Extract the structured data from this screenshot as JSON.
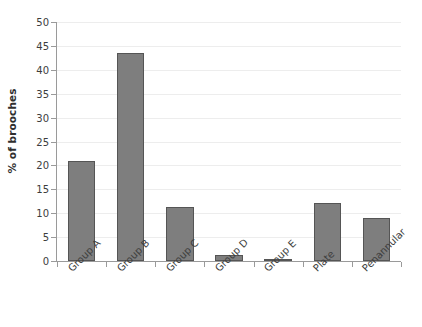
{
  "chart_data": {
    "type": "bar",
    "title": "",
    "subtitle": "",
    "xlabel": "",
    "ylabel": "% of brooches",
    "categories": [
      "Group A",
      "Group B",
      "Group C",
      "Group D",
      "Group E",
      "Plate",
      "Penannular"
    ],
    "values": [
      21.0,
      43.5,
      11.3,
      1.3,
      0.5,
      12.2,
      9.1
    ],
    "ylim": [
      0,
      50
    ],
    "ytick_step": 5,
    "yticks": [
      0,
      5,
      10,
      15,
      20,
      25,
      30,
      35,
      40,
      45,
      50
    ],
    "ytick_labels": [
      "0",
      "5",
      "10",
      "15",
      "20",
      "25",
      "30",
      "35",
      "40",
      "45",
      "50"
    ],
    "grid": true,
    "grid_axis": "y",
    "legend": false,
    "legend_position": "none",
    "bar_color": "#7e7e7e",
    "bar_border_color": "#555555",
    "grid_color": "#ededed",
    "axis_color": "#9a9a9a",
    "text_color": "#3d3d3d",
    "background_color": "#ffffff",
    "xtick_label_rotation": -45
  }
}
